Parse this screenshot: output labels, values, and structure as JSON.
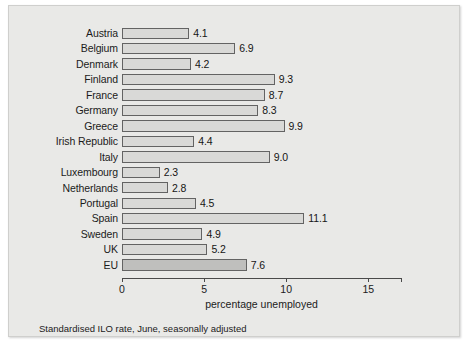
{
  "chart_data": {
    "type": "bar",
    "orientation": "horizontal",
    "title": "",
    "xlabel": "percentage unemployed",
    "ylabel": "",
    "xlim": [
      0,
      17
    ],
    "xticks": [
      0,
      5,
      10,
      15
    ],
    "xtick_labels": [
      "0",
      "5",
      "10",
      "15"
    ],
    "grid": false,
    "legend": null,
    "footnote": "Standardised ILO rate, June, seasonally adjusted",
    "categories": [
      "Austria",
      "Belgium",
      "Denmark",
      "Finland",
      "France",
      "Germany",
      "Greece",
      "Irish Republic",
      "Italy",
      "Luxembourg",
      "Netherlands",
      "Portugal",
      "Spain",
      "Sweden",
      "UK",
      "EU"
    ],
    "values": [
      4.1,
      6.9,
      4.2,
      9.3,
      8.7,
      8.3,
      9.9,
      4.4,
      9.0,
      2.3,
      2.8,
      4.5,
      11.1,
      4.9,
      5.2,
      7.6
    ],
    "value_labels": [
      "4.1",
      "6.9",
      "4.2",
      "9.3",
      "8.7",
      "8.3",
      "9.9",
      "4.4",
      "9.0",
      "2.3",
      "2.8",
      "4.5",
      "11.1",
      "4.9",
      "5.2",
      "7.6"
    ],
    "highlight_index": 15,
    "colors": {
      "panel_background": "#e9e9e7",
      "bar_fill": "#d9d9d7",
      "bar_fill_highlight": "#bfbfbd",
      "bar_border": "#636363",
      "axis": "#4a4a4a",
      "text": "#1b1b1b"
    }
  }
}
